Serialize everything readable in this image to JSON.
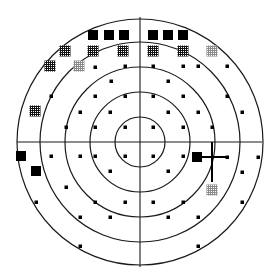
{
  "diagram": {
    "type": "visual-field-polar-plot",
    "center": {
      "x": 140,
      "y": 142
    },
    "rings": [
      25,
      50,
      75,
      100,
      123
    ],
    "axes": {
      "horizontal": {
        "x1": 17,
        "x2": 262
      },
      "vertical": {
        "y1": 17,
        "y2": 267
      }
    },
    "colors": {
      "line": "#1a1a1a",
      "marker": "#000000",
      "grid_dark": "#222222",
      "grid_light": "#888888",
      "background": "#ffffff"
    },
    "markers": {
      "black_squares": [
        {
          "x": 93,
          "y": 35
        },
        {
          "x": 109,
          "y": 35
        },
        {
          "x": 124,
          "y": 35
        },
        {
          "x": 153,
          "y": 35
        },
        {
          "x": 168,
          "y": 35
        },
        {
          "x": 183,
          "y": 35
        },
        {
          "x": 21,
          "y": 156
        },
        {
          "x": 36,
          "y": 171
        },
        {
          "x": 197,
          "y": 157
        }
      ],
      "dark_grid_squares": [
        {
          "x": 65,
          "y": 51
        },
        {
          "x": 93,
          "y": 51
        },
        {
          "x": 123,
          "y": 51
        },
        {
          "x": 153,
          "y": 51
        },
        {
          "x": 183,
          "y": 51
        },
        {
          "x": 50,
          "y": 66
        },
        {
          "x": 35,
          "y": 111
        }
      ],
      "light_grid_squares": [
        {
          "x": 79,
          "y": 66
        },
        {
          "x": 212,
          "y": 51
        },
        {
          "x": 212,
          "y": 190
        }
      ],
      "dots": [
        {
          "x": 95,
          "y": 67
        },
        {
          "x": 125,
          "y": 66
        },
        {
          "x": 153,
          "y": 66
        },
        {
          "x": 183,
          "y": 66
        },
        {
          "x": 198,
          "y": 66
        },
        {
          "x": 227,
          "y": 66
        },
        {
          "x": 111,
          "y": 81
        },
        {
          "x": 168,
          "y": 81
        },
        {
          "x": 51,
          "y": 96
        },
        {
          "x": 95,
          "y": 96
        },
        {
          "x": 125,
          "y": 96
        },
        {
          "x": 153,
          "y": 96
        },
        {
          "x": 183,
          "y": 96
        },
        {
          "x": 227,
          "y": 96
        },
        {
          "x": 80,
          "y": 112
        },
        {
          "x": 110,
          "y": 112
        },
        {
          "x": 168,
          "y": 112
        },
        {
          "x": 198,
          "y": 112
        },
        {
          "x": 242,
          "y": 112
        },
        {
          "x": 66,
          "y": 127
        },
        {
          "x": 95,
          "y": 127
        },
        {
          "x": 125,
          "y": 127
        },
        {
          "x": 153,
          "y": 127
        },
        {
          "x": 183,
          "y": 127
        },
        {
          "x": 212,
          "y": 127
        },
        {
          "x": 51,
          "y": 156
        },
        {
          "x": 80,
          "y": 156
        },
        {
          "x": 95,
          "y": 156
        },
        {
          "x": 125,
          "y": 156
        },
        {
          "x": 153,
          "y": 156
        },
        {
          "x": 183,
          "y": 156
        },
        {
          "x": 227,
          "y": 157
        },
        {
          "x": 258,
          "y": 157
        },
        {
          "x": 110,
          "y": 171
        },
        {
          "x": 168,
          "y": 171
        },
        {
          "x": 242,
          "y": 172
        },
        {
          "x": 66,
          "y": 187
        },
        {
          "x": 36,
          "y": 202
        },
        {
          "x": 95,
          "y": 202
        },
        {
          "x": 125,
          "y": 202
        },
        {
          "x": 153,
          "y": 202
        },
        {
          "x": 183,
          "y": 202
        },
        {
          "x": 242,
          "y": 202
        },
        {
          "x": 80,
          "y": 217
        },
        {
          "x": 110,
          "y": 217
        },
        {
          "x": 168,
          "y": 217
        },
        {
          "x": 198,
          "y": 217
        },
        {
          "x": 80,
          "y": 246
        },
        {
          "x": 198,
          "y": 246
        }
      ]
    },
    "blind_spot_cross": {
      "hx1": 197,
      "hx2": 227,
      "hy": 157,
      "vx": 212,
      "vy1": 142,
      "vy2": 182
    }
  }
}
